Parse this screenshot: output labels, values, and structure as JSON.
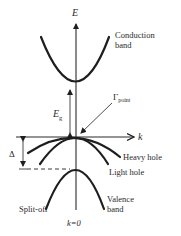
{
  "diagram": {
    "axes": {
      "energy_label": "E",
      "k_label": "k",
      "origin_label": "k=0"
    },
    "bands": {
      "conduction": {
        "line1": "Conduction",
        "line2": "band"
      },
      "heavy_hole": "Heavy hole",
      "light_hole": "Light hole",
      "split_off": "Split-off",
      "valence": {
        "line1": "Valence",
        "line2": "band"
      }
    },
    "annotations": {
      "band_gap_symbol": "E",
      "band_gap_subscript": "g",
      "gamma_symbol": "Γ",
      "gamma_subscript": "point",
      "spin_orbit_symbol": "Δ"
    },
    "colors": {
      "line": "#1e1e1e",
      "text": "#2a2a2a",
      "background": "#ffffff"
    }
  }
}
